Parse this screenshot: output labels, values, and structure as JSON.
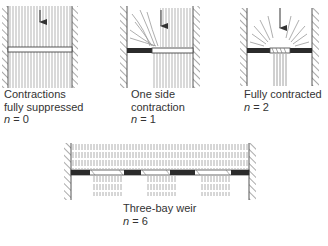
{
  "panels": [
    {
      "id": "suppressed",
      "caption_lines": [
        "Contractions",
        "fully suppressed"
      ],
      "n_label": "n",
      "n_value": "= 0"
    },
    {
      "id": "one-side",
      "caption_lines": [
        "One side",
        "contraction"
      ],
      "n_label": "n",
      "n_value": "= 1"
    },
    {
      "id": "fully",
      "caption_lines": [
        "Fully contracted"
      ],
      "n_label": "n",
      "n_value": "= 2"
    },
    {
      "id": "three-bay",
      "caption_lines": [
        "Three-bay weir"
      ],
      "n_label": "n",
      "n_value": "= 6"
    }
  ],
  "colors": {
    "wall": "#555555",
    "plate": "#2b2b2b",
    "flow": "#8a8a8a",
    "text": "#333333"
  }
}
